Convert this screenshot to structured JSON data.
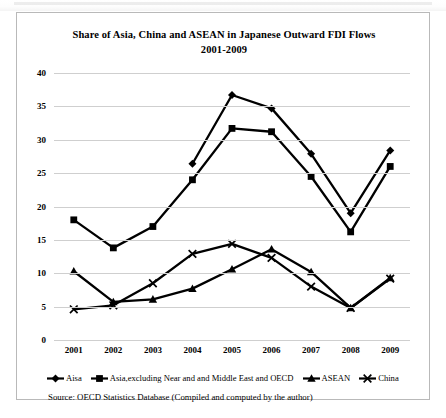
{
  "figure": {
    "title_line1": "Share of Asia, China and ASEAN in Japanese Outward FDI Flows",
    "title_line2": "2001-2009",
    "source_note": "Source: OECD  Statistics Database (Compiled  and computed by the author)"
  },
  "legend": {
    "items": [
      {
        "label": "Aisa",
        "marker": "diamond-marker",
        "color": "#000000"
      },
      {
        "label": "Asia,excluding Near and and Middle East and OECD",
        "marker": "square-marker",
        "color": "#000000"
      },
      {
        "label": "ASEAN",
        "marker": "triangle-marker",
        "color": "#000000"
      },
      {
        "label": "China",
        "marker": "cross-marker",
        "color": "#000000"
      }
    ]
  },
  "chart_data": {
    "type": "line",
    "title": "Share of Asia, China and ASEAN in Japanese Outward FDI Flows 2001-2009",
    "xlabel": "",
    "ylabel": "",
    "categories": [
      "2001",
      "2002",
      "2003",
      "2004",
      "2005",
      "2006",
      "2007",
      "2008",
      "2009"
    ],
    "ylim": [
      0,
      40
    ],
    "yticks": [
      0,
      5,
      10,
      15,
      20,
      25,
      30,
      35,
      40
    ],
    "grid": true,
    "legend_position": "bottom",
    "series": [
      {
        "name": "Aisa",
        "marker": "diamond-marker",
        "values": [
          null,
          null,
          null,
          26.4,
          36.7,
          34.7,
          27.9,
          19.0,
          28.4
        ]
      },
      {
        "name": "Asia,excluding Near and and Middle East and OECD",
        "marker": "square-marker",
        "values": [
          18.0,
          13.8,
          17.0,
          24.0,
          31.7,
          31.2,
          24.5,
          16.2,
          26.0
        ]
      },
      {
        "name": "ASEAN",
        "marker": "triangle-marker",
        "values": [
          10.3,
          5.7,
          6.1,
          7.7,
          10.6,
          13.6,
          10.2,
          4.8,
          9.3
        ]
      },
      {
        "name": "China",
        "marker": "cross-marker",
        "values": [
          4.6,
          5.2,
          8.5,
          12.9,
          14.4,
          12.3,
          8.0,
          4.8,
          9.2
        ]
      }
    ]
  }
}
